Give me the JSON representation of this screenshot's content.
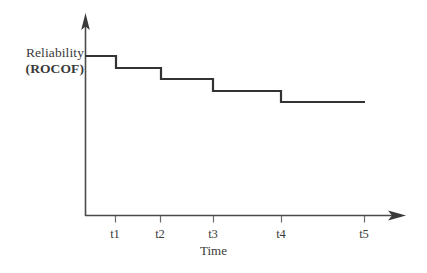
{
  "figure": {
    "width": 427,
    "height": 273,
    "background": "#ffffff"
  },
  "labels": {
    "y_axis_line1": "Reliability",
    "y_axis_line2": "(ROCOF)",
    "x_axis_title": "Time"
  },
  "chart_data": {
    "type": "line",
    "subtype": "step-decreasing",
    "title": "",
    "subtitle": "",
    "xlabel": "Time",
    "ylabel": "Reliability (ROCOF)",
    "grid": false,
    "legend": false,
    "legend_position": "none",
    "line_color": "#333333",
    "axis_color": "#555555",
    "line_width": 2.2,
    "categories": [
      "t1",
      "t2",
      "t3",
      "t4",
      "t5"
    ],
    "tick_labels": [
      "t1",
      "t2",
      "t3",
      "t4",
      "t5"
    ],
    "tick_x_px": [
      115,
      160,
      213,
      281,
      364
    ],
    "x_axis_range_px": [
      85,
      405
    ],
    "y_axis_range_px": [
      216,
      14
    ],
    "step_levels": [
      5,
      4,
      3,
      2,
      1
    ],
    "step_level_y_px": [
      56,
      68,
      79,
      91,
      102
    ],
    "step_break_x_px": [
      116,
      161,
      213,
      281
    ],
    "step_start_x_px": 85,
    "step_end_x_px": 365,
    "series": [
      {
        "name": "ROCOF",
        "x": [
          "start",
          "t1",
          "t2",
          "t3",
          "t4",
          "t5"
        ],
        "values": [
          5,
          4,
          3,
          2,
          1,
          1
        ],
        "note": "Rate of occurrence of failures decreases in discrete steps after each corrective action at t1..t4, then stays constant to t5."
      }
    ],
    "annotations": []
  }
}
